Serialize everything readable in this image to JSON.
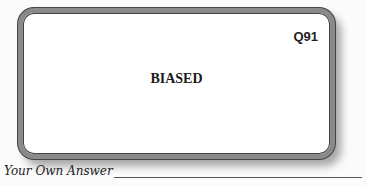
{
  "card": {
    "question_number": "Q91",
    "term": "BIASED"
  },
  "answer": {
    "label": "Your Own Answer",
    "value": ""
  }
}
